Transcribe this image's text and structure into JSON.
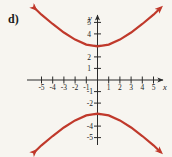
{
  "figure": {
    "problem_label": "d)",
    "background_color": "#f7f5f0",
    "curve_color": "#c0392b",
    "axis_color": "#2a2a2a"
  },
  "axes": {
    "x_name": "x",
    "y_name": "y",
    "x_ticks": [
      -5,
      -4,
      -3,
      -2,
      -1,
      1,
      2,
      3,
      4,
      5
    ],
    "y_ticks": [
      5,
      4,
      2,
      1,
      -1,
      -2,
      -4,
      -5
    ],
    "x_tick_labels": [
      "-5",
      "-4",
      "-3",
      "-2",
      "-1",
      "1",
      "2",
      "3",
      "4",
      "5"
    ],
    "y_tick_labels": [
      "5",
      "4",
      "2",
      "1",
      "-1",
      "-2",
      "-4",
      "-5"
    ],
    "hidden_y_tick_labels": [
      "3",
      "-3"
    ]
  },
  "chart_data": {
    "type": "line",
    "title": "d)",
    "xlabel": "x",
    "ylabel": "y",
    "xlim": [
      -6.2,
      6.2
    ],
    "ylim": [
      -6.6,
      6.6
    ],
    "grid": false,
    "legend": null,
    "equation": "y^2/9 - x^2/9 = 1",
    "center": [
      0,
      0
    ],
    "vertices": [
      [
        0,
        3
      ],
      [
        0,
        -3
      ]
    ],
    "series": [
      {
        "name": "upper branch",
        "x": [
          -5.6,
          -5.0,
          -4.0,
          -3.0,
          -2.0,
          -1.0,
          0.0,
          1.0,
          2.0,
          3.0,
          4.0,
          5.0,
          5.6
        ],
        "y": [
          6.4,
          5.83,
          5.0,
          4.24,
          3.61,
          3.16,
          3.0,
          3.16,
          3.61,
          4.24,
          5.0,
          5.83,
          6.4
        ]
      },
      {
        "name": "lower branch",
        "x": [
          -5.6,
          -5.0,
          -4.0,
          -3.0,
          -2.0,
          -1.0,
          0.0,
          1.0,
          2.0,
          3.0,
          4.0,
          5.0,
          5.6
        ],
        "y": [
          -6.4,
          -5.83,
          -5.0,
          -4.24,
          -3.61,
          -3.16,
          -3.0,
          -3.16,
          -3.61,
          -4.24,
          -5.0,
          -5.83,
          -6.4
        ]
      }
    ]
  }
}
